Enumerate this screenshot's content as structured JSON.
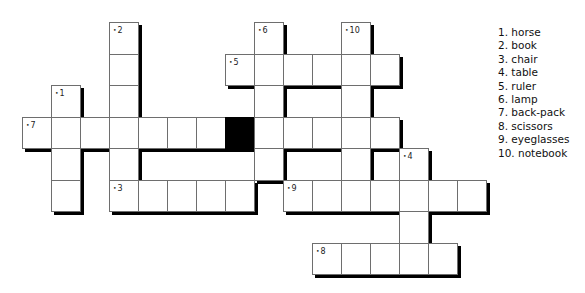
{
  "puzzle": {
    "grid": {
      "origin_x": 22,
      "origin_y": 22,
      "cell_w": 29,
      "cell_h": 31.5,
      "shadow_color": "#000000",
      "cells": [
        {
          "r": 0,
          "c": 3,
          "n": "2"
        },
        {
          "r": 0,
          "c": 8,
          "n": "6"
        },
        {
          "r": 0,
          "c": 11,
          "n": "10"
        },
        {
          "r": 1,
          "c": 3
        },
        {
          "r": 1,
          "c": 7,
          "n": "5"
        },
        {
          "r": 1,
          "c": 8
        },
        {
          "r": 1,
          "c": 9
        },
        {
          "r": 1,
          "c": 10
        },
        {
          "r": 1,
          "c": 11
        },
        {
          "r": 1,
          "c": 12
        },
        {
          "r": 2,
          "c": 1,
          "n": "1"
        },
        {
          "r": 2,
          "c": 3
        },
        {
          "r": 2,
          "c": 8
        },
        {
          "r": 2,
          "c": 11
        },
        {
          "r": 3,
          "c": 0,
          "n": "7"
        },
        {
          "r": 3,
          "c": 1
        },
        {
          "r": 3,
          "c": 2
        },
        {
          "r": 3,
          "c": 3
        },
        {
          "r": 3,
          "c": 4
        },
        {
          "r": 3,
          "c": 5
        },
        {
          "r": 3,
          "c": 6
        },
        {
          "r": 3,
          "c": 7,
          "black": true
        },
        {
          "r": 3,
          "c": 8
        },
        {
          "r": 3,
          "c": 9
        },
        {
          "r": 3,
          "c": 10
        },
        {
          "r": 3,
          "c": 11
        },
        {
          "r": 3,
          "c": 12
        },
        {
          "r": 4,
          "c": 1
        },
        {
          "r": 4,
          "c": 3
        },
        {
          "r": 4,
          "c": 8
        },
        {
          "r": 4,
          "c": 11
        },
        {
          "r": 4,
          "c": 13,
          "n": "4"
        },
        {
          "r": 5,
          "c": 1
        },
        {
          "r": 5,
          "c": 3,
          "n": "3"
        },
        {
          "r": 5,
          "c": 4
        },
        {
          "r": 5,
          "c": 5
        },
        {
          "r": 5,
          "c": 6
        },
        {
          "r": 5,
          "c": 7
        },
        {
          "r": 5,
          "c": 9,
          "n": "9"
        },
        {
          "r": 5,
          "c": 10
        },
        {
          "r": 5,
          "c": 11
        },
        {
          "r": 5,
          "c": 12
        },
        {
          "r": 5,
          "c": 13
        },
        {
          "r": 5,
          "c": 14
        },
        {
          "r": 5,
          "c": 15
        },
        {
          "r": 6,
          "c": 13
        },
        {
          "r": 7,
          "c": 10,
          "n": "8"
        },
        {
          "r": 7,
          "c": 11
        },
        {
          "r": 7,
          "c": 12
        },
        {
          "r": 7,
          "c": 13
        },
        {
          "r": 7,
          "c": 14
        }
      ]
    },
    "word_list": [
      "1. horse",
      "2. book",
      "3. chair",
      "4. table",
      "5. ruler",
      "6. lamp",
      "7. back-pack",
      "8. scissors",
      "9. eyeglasses",
      "10. notebook"
    ]
  }
}
